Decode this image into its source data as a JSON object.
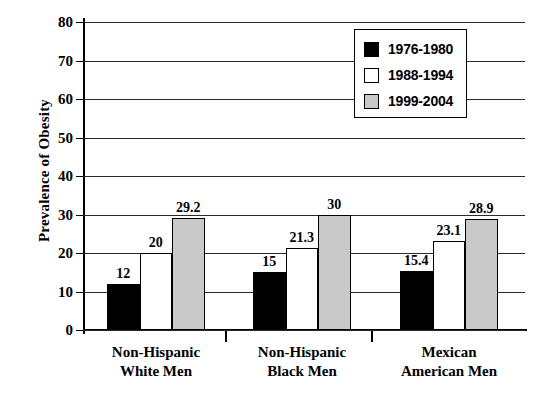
{
  "chart_data": {
    "type": "bar",
    "title": "",
    "xlabel": "",
    "ylabel": "Prevalence of Obesity",
    "ylim": [
      0,
      80
    ],
    "yticks": [
      0,
      10,
      20,
      30,
      40,
      50,
      60,
      70,
      80
    ],
    "grid": true,
    "legend_position": "top-right",
    "categories": [
      "Non-Hispanic White Men",
      "Non-Hispanic Black Men",
      "Mexican American Men"
    ],
    "category_lines": [
      [
        "Non-Hispanic",
        "White Men"
      ],
      [
        "Non-Hispanic",
        "Black Men"
      ],
      [
        "Mexican",
        "American Men"
      ]
    ],
    "series": [
      {
        "name": "1976-1980",
        "color": "#000000",
        "values": [
          12,
          15,
          15.4
        ],
        "labels": [
          "12",
          "15",
          "15.4"
        ]
      },
      {
        "name": "1988-1994",
        "color": "#ffffff",
        "values": [
          20,
          21.3,
          23.1
        ],
        "labels": [
          "20",
          "21.3",
          "23.1"
        ]
      },
      {
        "name": "1999-2004",
        "color": "#c9c9c9",
        "values": [
          29.2,
          30,
          28.9
        ],
        "labels": [
          "29.2",
          "30",
          "28.9"
        ]
      }
    ]
  },
  "axis": {
    "y_title": "Prevalence of Obesity",
    "y_tick_labels": [
      "80",
      "70",
      "60",
      "50",
      "40",
      "30",
      "20",
      "10",
      "0"
    ]
  },
  "legend": {
    "items": [
      {
        "label": "1976-1980",
        "swatch": "black-square-swatch"
      },
      {
        "label": "1988-1994",
        "swatch": "white-square-swatch"
      },
      {
        "label": "1999-2004",
        "swatch": "gray-square-swatch"
      }
    ]
  }
}
